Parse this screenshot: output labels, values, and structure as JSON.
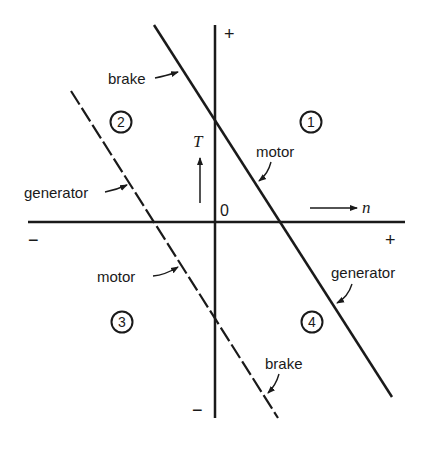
{
  "diagram": {
    "axes": {
      "vertical_label": "T",
      "horizontal_label": "n",
      "origin_label": "0",
      "vertical_top_sign": "+",
      "vertical_bottom_sign": "−",
      "horizontal_left_sign": "−",
      "horizontal_right_sign": "+"
    },
    "quadrants": [
      {
        "number": "1",
        "label": "①"
      },
      {
        "number": "2",
        "label": "②"
      },
      {
        "number": "3",
        "label": "③"
      },
      {
        "number": "4",
        "label": "④"
      }
    ],
    "solid_line": {
      "style": "solid",
      "annotations": {
        "upper": "brake",
        "middle": "motor",
        "lower": "generator"
      }
    },
    "dashed_line": {
      "style": "dashed",
      "annotations": {
        "upper": "generator",
        "middle": "motor",
        "lower": "brake"
      }
    },
    "colors": {
      "ink": "#1a1a1a",
      "background": "#ffffff"
    }
  }
}
